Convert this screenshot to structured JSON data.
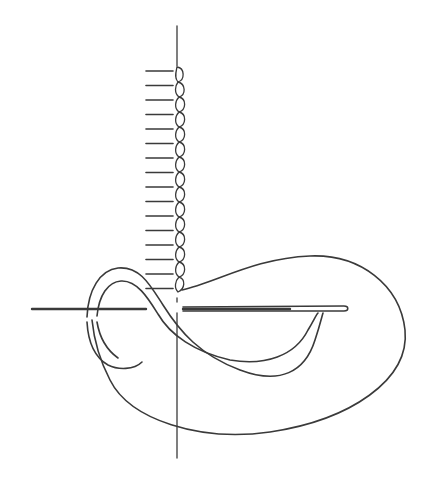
{
  "figure": {
    "caption_cropped": "",
    "colors": {
      "ink": "#3a3a3a",
      "background": "#ffffff"
    },
    "elements": {
      "guide_line": {
        "x": 177,
        "y_start": 26,
        "y_end": 458
      },
      "tick_marks": {
        "count": 16,
        "x_start": 146,
        "x_end": 173,
        "y_first": 71,
        "spacing": 14.5
      },
      "chain_stitches": {
        "count": 16,
        "x": 179,
        "y_start": 68,
        "y_end": 292
      },
      "needle": {
        "y": 309,
        "x_start": 183,
        "x_end": 347
      },
      "thread_tail": {
        "y": 309,
        "x_start": 32,
        "x_end": 146
      }
    }
  }
}
